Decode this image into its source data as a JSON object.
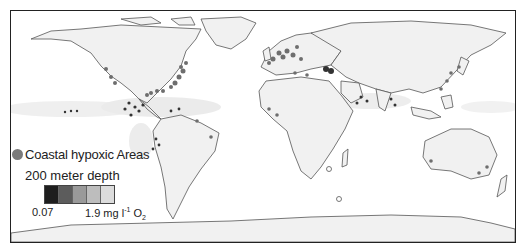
{
  "map": {
    "title": "Global oxygen minimum zones and coastal hypoxic areas",
    "land_color": "#f1f1f1",
    "ocean_color": "#ffffff",
    "coast_color": "#555555",
    "hypoxic_dot_color": "#6e6e6e"
  },
  "legend": {
    "hypoxic": {
      "icon": "gray-circle-icon",
      "label": "Coastal hypoxic Areas"
    },
    "depth_title": "200 meter depth",
    "scale": {
      "swatches": [
        "#1e1e1e",
        "#5c5c5c",
        "#9a9a9a",
        "#bdbdbd",
        "#dcdcdc"
      ],
      "min_label": "0.07",
      "max_value": "1.9",
      "max_unit_text": "mg l",
      "max_unit_sup": "-1",
      "max_unit_o": "O",
      "max_unit_sub": "2"
    }
  }
}
